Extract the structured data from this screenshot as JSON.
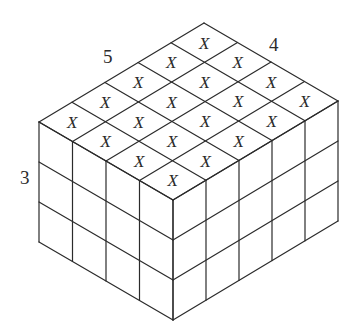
{
  "figure": {
    "type": "isometric cuboid of unit cubes",
    "dimensions": {
      "length": 5,
      "width": 4,
      "height": 3
    },
    "labels": {
      "length": "5",
      "width": "4",
      "height": "3"
    },
    "top_face_mark": "X",
    "marked_cells_count": 20,
    "top_face_marks": [
      [
        "X",
        "X",
        "X",
        "X"
      ],
      [
        "X",
        "X",
        "X",
        "X"
      ],
      [
        "X",
        "X",
        "X",
        "X"
      ],
      [
        "X",
        "X",
        "X",
        "X"
      ],
      [
        "X",
        "X",
        "X",
        "X"
      ]
    ],
    "colors": {
      "line": "#2b2b2b",
      "background": "#ffffff"
    }
  }
}
